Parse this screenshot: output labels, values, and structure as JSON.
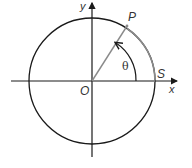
{
  "diagram": {
    "labels": {
      "y_axis": "y",
      "x_axis": "x",
      "origin": "O",
      "point_p": "P",
      "point_s": "S",
      "angle": "θ"
    },
    "colors": {
      "circle": "#1a1a1a",
      "axes": "#1a1a1a",
      "radius_line": "#888888",
      "arc_highlight": "#888888",
      "angle_arrow": "#1a1a1a"
    }
  }
}
